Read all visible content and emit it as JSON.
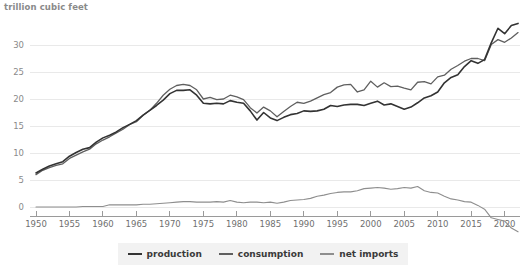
{
  "chart_data": {
    "type": "line",
    "title": "trillion cubic feet",
    "xlabel": "",
    "ylabel": "trillion cubic feet",
    "xlim": [
      1949,
      2022
    ],
    "ylim": [
      -2,
      34
    ],
    "yticks": [
      0,
      5,
      10,
      15,
      20,
      25,
      30
    ],
    "xticks": [
      1950,
      1955,
      1960,
      1965,
      1970,
      1975,
      1980,
      1985,
      1990,
      1995,
      2000,
      2005,
      2010,
      2015,
      2020
    ],
    "grid": true,
    "legend_position": "bottom-center",
    "x": [
      1950,
      1951,
      1952,
      1953,
      1954,
      1955,
      1956,
      1957,
      1958,
      1959,
      1960,
      1961,
      1962,
      1963,
      1964,
      1965,
      1966,
      1967,
      1968,
      1969,
      1970,
      1971,
      1972,
      1973,
      1974,
      1975,
      1976,
      1977,
      1978,
      1979,
      1980,
      1981,
      1982,
      1983,
      1984,
      1985,
      1986,
      1987,
      1988,
      1989,
      1990,
      1991,
      1992,
      1993,
      1994,
      1995,
      1996,
      1997,
      1998,
      1999,
      2000,
      2001,
      2002,
      2003,
      2004,
      2005,
      2006,
      2007,
      2008,
      2009,
      2010,
      2011,
      2012,
      2013,
      2014,
      2015,
      2016,
      2017,
      2018,
      2019,
      2020,
      2021,
      2022
    ],
    "series": [
      {
        "name": "production",
        "color": "#333333",
        "values": [
          6.3,
          7.0,
          7.6,
          8.0,
          8.4,
          9.4,
          10.1,
          10.7,
          11.0,
          12.0,
          12.8,
          13.3,
          13.9,
          14.7,
          15.3,
          16.0,
          17.0,
          17.9,
          18.8,
          19.8,
          21.0,
          21.6,
          21.6,
          21.7,
          20.7,
          19.2,
          19.1,
          19.2,
          19.1,
          19.7,
          19.4,
          19.2,
          17.8,
          16.1,
          17.5,
          16.5,
          16.0,
          16.6,
          17.1,
          17.3,
          17.8,
          17.7,
          17.8,
          18.1,
          18.8,
          18.6,
          18.9,
          19.0,
          19.0,
          18.8,
          19.2,
          19.6,
          18.9,
          19.1,
          18.6,
          18.1,
          18.5,
          19.3,
          20.2,
          20.6,
          21.3,
          23.0,
          24.0,
          24.5,
          26.0,
          27.1,
          26.6,
          27.3,
          30.4,
          33.1,
          32.1,
          33.6,
          34.0
        ]
      },
      {
        "name": "consumption",
        "color": "#5f5f5f",
        "values": [
          6.0,
          6.8,
          7.3,
          7.7,
          8.0,
          9.0,
          9.6,
          10.2,
          10.7,
          11.7,
          12.4,
          13.0,
          13.7,
          14.4,
          15.3,
          15.8,
          17.0,
          17.9,
          19.2,
          20.7,
          21.8,
          22.5,
          22.7,
          22.5,
          21.7,
          20.0,
          20.3,
          19.9,
          20.0,
          20.7,
          20.4,
          19.9,
          18.4,
          17.4,
          18.5,
          17.8,
          16.7,
          17.7,
          18.6,
          19.4,
          19.2,
          19.6,
          20.2,
          20.8,
          21.2,
          22.2,
          22.6,
          22.7,
          21.3,
          21.7,
          23.3,
          22.2,
          23.0,
          22.3,
          22.4,
          22.0,
          21.7,
          23.1,
          23.2,
          22.8,
          24.1,
          24.4,
          25.5,
          26.2,
          27.0,
          27.5,
          27.5,
          27.1,
          30.1,
          31.0,
          30.5,
          31.3,
          32.3
        ]
      },
      {
        "name": "net imports",
        "color": "#8e8e8e",
        "values": [
          0.0,
          0.0,
          0.0,
          0.0,
          0.0,
          0.0,
          0.0,
          0.1,
          0.1,
          0.1,
          0.1,
          0.4,
          0.4,
          0.4,
          0.4,
          0.4,
          0.5,
          0.5,
          0.6,
          0.7,
          0.8,
          0.9,
          1.0,
          1.0,
          0.9,
          0.9,
          0.9,
          1.0,
          0.9,
          1.2,
          0.9,
          0.8,
          0.9,
          0.9,
          0.8,
          0.9,
          0.7,
          0.9,
          1.2,
          1.3,
          1.4,
          1.6,
          2.0,
          2.2,
          2.5,
          2.7,
          2.8,
          2.8,
          3.0,
          3.4,
          3.5,
          3.6,
          3.5,
          3.3,
          3.4,
          3.6,
          3.5,
          3.8,
          3.0,
          2.7,
          2.6,
          2.0,
          1.5,
          1.3,
          1.0,
          0.9,
          0.3,
          -0.4,
          -2.0,
          -2.3,
          -2.6,
          -3.9,
          -4.6
        ]
      }
    ]
  },
  "legend": {
    "items": [
      {
        "label": "production",
        "color": "#333333"
      },
      {
        "label": "consumption",
        "color": "#5f5f5f"
      },
      {
        "label": "net imports",
        "color": "#8e8e8e"
      }
    ]
  }
}
